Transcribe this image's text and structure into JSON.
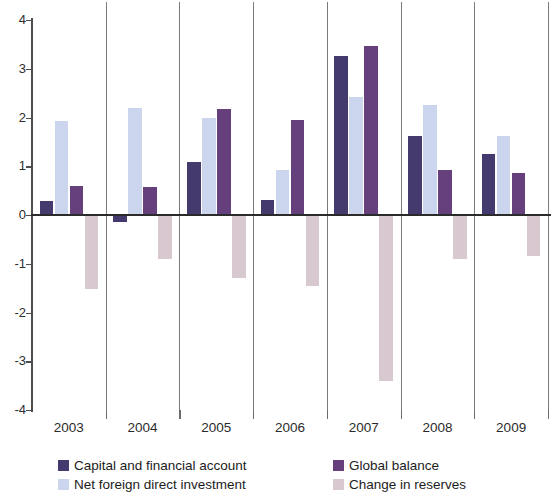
{
  "chart_data": {
    "type": "bar",
    "title": "",
    "subtitle": "",
    "xlabel": "",
    "ylabel": "",
    "categories": [
      "2003",
      "2004",
      "2005",
      "2006",
      "2007",
      "2008",
      "2009"
    ],
    "ylim": [
      -4,
      4
    ],
    "yticks": [
      4,
      3,
      2,
      1,
      0,
      -1,
      -2,
      -3,
      -4
    ],
    "ytick_labels": [
      "4",
      "3",
      "2",
      "1",
      "0",
      "-1",
      "-2",
      "-3",
      "-4"
    ],
    "grid": false,
    "group_separators": true,
    "legend_position": "bottom",
    "series": [
      {
        "name": "Capital and financial account",
        "color": "#443a6e",
        "values": [
          0.28,
          -0.15,
          1.08,
          0.3,
          3.27,
          1.62,
          1.25
        ]
      },
      {
        "name": "Net foreign direct investment",
        "color": "#ccd5ee",
        "values": [
          1.92,
          2.2,
          2.0,
          0.93,
          2.42,
          2.25,
          1.62
        ]
      },
      {
        "name": "Global balance",
        "color": "#66407c",
        "values": [
          0.6,
          0.58,
          2.17,
          1.95,
          3.46,
          0.92,
          0.86
        ]
      },
      {
        "name": "Change in reserves",
        "color": "#d8c8cf",
        "values": [
          -1.52,
          -0.9,
          -1.3,
          -1.45,
          -3.4,
          -0.9,
          -0.85
        ]
      }
    ]
  },
  "legend": {
    "items": [
      {
        "label": "Capital and financial account",
        "color": "#443a6e"
      },
      {
        "label": "Net foreign direct investment",
        "color": "#ccd5ee"
      },
      {
        "label": "Global balance",
        "color": "#66407c"
      },
      {
        "label": "Change in reserves",
        "color": "#d8c8cf"
      }
    ]
  }
}
